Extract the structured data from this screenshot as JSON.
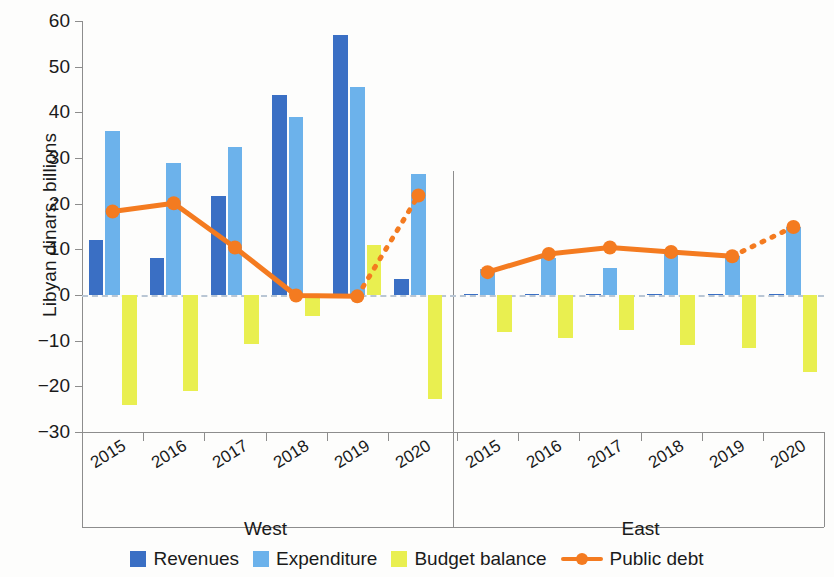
{
  "chart_data": {
    "type": "bar",
    "title": "",
    "xlabel": "",
    "ylabel": "Libyan dinars, billions",
    "ylim": [
      -30,
      60
    ],
    "yticks": [
      60,
      50,
      40,
      30,
      20,
      10,
      0,
      -10,
      -20,
      -30
    ],
    "ytick_labels": [
      "60",
      "50",
      "40",
      "30",
      "20",
      "10",
      "0",
      "−10",
      "−20",
      "−30"
    ],
    "grid": false,
    "legend_position": "bottom",
    "groups": [
      {
        "name": "West",
        "categories": [
          "2015",
          "2016",
          "2017",
          "2018",
          "2019",
          "2020"
        ],
        "series": [
          {
            "name": "Revenues",
            "type": "bar",
            "color": "#3a6fc4",
            "values": [
              12.0,
              8.1,
              21.7,
              43.7,
              57.0,
              3.5
            ]
          },
          {
            "name": "Expenditure",
            "type": "bar",
            "color": "#6cb2eb",
            "values": [
              36.0,
              29.0,
              32.4,
              38.9,
              45.6,
              26.4
            ]
          },
          {
            "name": "Budget balance",
            "type": "bar",
            "color": "#e9ef50",
            "values": [
              -24.0,
              -21.0,
              -10.7,
              -4.5,
              10.9,
              -22.8
            ]
          },
          {
            "name": "Public debt",
            "type": "line",
            "color": "#f47b20",
            "values": [
              18.3,
              20.1,
              10.4,
              -0.1,
              -0.3,
              21.8
            ],
            "dashed_from_index": 4
          }
        ]
      },
      {
        "name": "East",
        "categories": [
          "2015",
          "2016",
          "2017",
          "2018",
          "2019",
          "2020"
        ],
        "series": [
          {
            "name": "Revenues",
            "type": "bar",
            "color": "#3a6fc4",
            "values": [
              0.3,
              0.3,
              0.3,
              0.3,
              0.3,
              0.3
            ]
          },
          {
            "name": "Expenditure",
            "type": "bar",
            "color": "#6cb2eb",
            "values": [
              5.7,
              8.0,
              6.0,
              9.2,
              8.5,
              14.9
            ]
          },
          {
            "name": "Budget balance",
            "type": "bar",
            "color": "#e9ef50",
            "values": [
              -8.0,
              -9.4,
              -7.7,
              -11.0,
              -11.5,
              -16.8
            ]
          },
          {
            "name": "Public debt",
            "type": "line",
            "color": "#f47b20",
            "values": [
              5.0,
              9.0,
              10.4,
              9.4,
              8.5,
              14.9
            ],
            "dashed_from_index": 4
          }
        ]
      }
    ],
    "legend": [
      {
        "label": "Revenues",
        "color": "#3a6fc4",
        "marker": "square"
      },
      {
        "label": "Expenditure",
        "color": "#6cb2eb",
        "marker": "square"
      },
      {
        "label": "Budget balance",
        "color": "#e9ef50",
        "marker": "square"
      },
      {
        "label": "Public debt",
        "color": "#f47b20",
        "marker": "line-dot"
      }
    ],
    "colors": {
      "revenues": "#3a6fc4",
      "expenditure": "#6cb2eb",
      "budget_balance": "#e9ef50",
      "public_debt": "#f47b20",
      "axis": "#8d8d8d",
      "zero_line": "#b9c6d4",
      "background": "#fdfdfc"
    }
  }
}
